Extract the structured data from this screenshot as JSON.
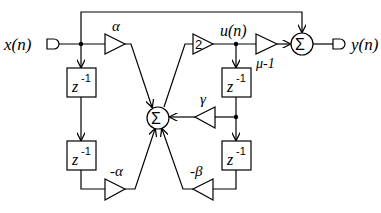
{
  "diagram": {
    "input_label": "x(n)",
    "output_label": "y(n)",
    "internal_label": "u(n)",
    "sum_symbol": "Σ",
    "delay_base": "z",
    "delay_exp": "-1",
    "gains": {
      "alpha": "α",
      "neg_alpha": "-α",
      "two": "2",
      "gamma": "γ",
      "neg_beta": "-β",
      "mu_minus_1": "μ-1"
    }
  }
}
